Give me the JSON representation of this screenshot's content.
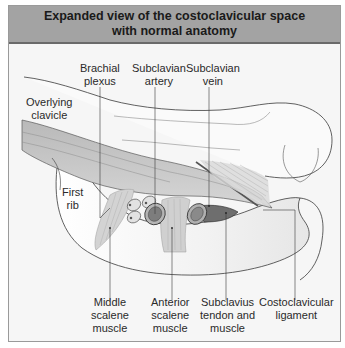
{
  "title": {
    "line1": "Expanded view of the costoclavicular space",
    "line2": "with normal anatomy"
  },
  "labels": {
    "brachial_plexus": [
      "Brachial",
      "plexus"
    ],
    "subclavian_artery": [
      "Subclavian",
      "artery"
    ],
    "subclavian_vein": [
      "Subclavian",
      "vein"
    ],
    "overlying_clavicle": [
      "Overlying",
      "clavicle"
    ],
    "first_rib": [
      "First",
      "rib"
    ],
    "middle_scalene": [
      "Middle",
      "scalene",
      "muscle"
    ],
    "anterior_scalene": [
      "Anterior",
      "scalene",
      "muscle"
    ],
    "subclavius": [
      "Subclavius",
      "tendon and",
      "muscle"
    ],
    "costoclavicular_ligament": [
      "Costoclavicular",
      "ligament"
    ]
  },
  "colors": {
    "title_bg": "#a3a3a3",
    "title_border": "#6a6a6a",
    "panel_bg": "#f6f6f6",
    "muscle_band": "#c4c4c4",
    "vessel_dark": "#7a7a7a",
    "outline": "#3a3a3a"
  }
}
